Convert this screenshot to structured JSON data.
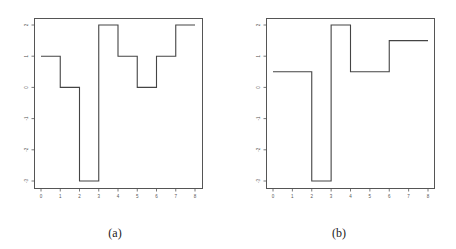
{
  "chart_data": [
    {
      "type": "line",
      "subtype": "step",
      "caption": "(a)",
      "title": "",
      "xlabel": "",
      "ylabel": "",
      "x_ticks": [
        0,
        1,
        2,
        3,
        4,
        5,
        6,
        7,
        8
      ],
      "y_ticks": [
        -3,
        -2,
        -1,
        0,
        1,
        2
      ],
      "xlim": [
        0,
        8
      ],
      "ylim": [
        -3,
        2
      ],
      "grid": false,
      "segments": [
        {
          "x0": 0,
          "x1": 1,
          "y": 1
        },
        {
          "x0": 1,
          "x1": 2,
          "y": 0
        },
        {
          "x0": 2,
          "x1": 3,
          "y": -3
        },
        {
          "x0": 3,
          "x1": 4,
          "y": 2
        },
        {
          "x0": 4,
          "x1": 5,
          "y": 1
        },
        {
          "x0": 5,
          "x1": 6,
          "y": 0
        },
        {
          "x0": 6,
          "x1": 7,
          "y": 1
        },
        {
          "x0": 7,
          "x1": 8,
          "y": 2
        }
      ]
    },
    {
      "type": "line",
      "subtype": "step",
      "caption": "(b)",
      "title": "",
      "xlabel": "",
      "ylabel": "",
      "x_ticks": [
        0,
        1,
        2,
        3,
        4,
        5,
        6,
        7,
        8
      ],
      "y_ticks": [
        -3,
        -2,
        -1,
        0,
        1,
        2
      ],
      "xlim": [
        0,
        8
      ],
      "ylim": [
        -3,
        2
      ],
      "grid": false,
      "segments": [
        {
          "x0": 0,
          "x1": 2,
          "y": 0.5
        },
        {
          "x0": 2,
          "x1": 3,
          "y": -3
        },
        {
          "x0": 3,
          "x1": 4,
          "y": 2
        },
        {
          "x0": 4,
          "x1": 6,
          "y": 0.5
        },
        {
          "x0": 6,
          "x1": 8,
          "y": 1.5
        }
      ]
    }
  ],
  "layout": {
    "panels": [
      {
        "frame": {
          "x": 34,
          "y": 18,
          "w": 168,
          "h": 170
        },
        "x0px": 41,
        "x8px": 195,
        "yTopPx": 25,
        "yBotPx": 181,
        "caption_x": 115
      },
      {
        "frame": {
          "x": 266,
          "y": 18,
          "w": 168,
          "h": 170
        },
        "x0px": 273,
        "x8px": 428,
        "yTopPx": 25,
        "yBotPx": 181,
        "caption_x": 339
      }
    ],
    "caption_y": 226
  }
}
